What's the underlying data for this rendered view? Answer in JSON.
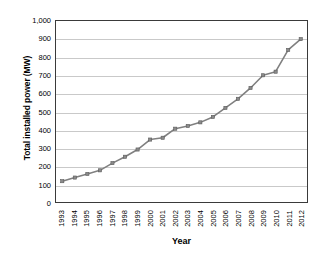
{
  "chart_data": {
    "type": "line",
    "title": "",
    "xlabel": "Year",
    "ylabel": "Total installed power (MW)",
    "categories": [
      "1993",
      "1994",
      "1995",
      "1996",
      "1997",
      "1998",
      "1999",
      "2000",
      "2001",
      "2002",
      "2003",
      "2004",
      "2005",
      "2006",
      "2007",
      "2008",
      "2009",
      "2010",
      "2011",
      "2012"
    ],
    "values": [
      115,
      135,
      155,
      175,
      215,
      250,
      290,
      345,
      355,
      405,
      420,
      440,
      470,
      520,
      570,
      630,
      700,
      720,
      840,
      900
    ],
    "series": [
      {
        "name": "Total installed power",
        "values": [
          115,
          135,
          155,
          175,
          215,
          250,
          290,
          345,
          355,
          405,
          420,
          440,
          470,
          520,
          570,
          630,
          700,
          720,
          840,
          900
        ]
      }
    ],
    "ylim": [
      0,
      1000
    ],
    "ytick_labels": [
      "1,000",
      "900",
      "800",
      "700",
      "600",
      "500",
      "400",
      "300",
      "200",
      "100",
      "0"
    ],
    "ytick_values": [
      1000,
      900,
      800,
      700,
      600,
      500,
      400,
      300,
      200,
      100,
      0
    ],
    "grid": "horizontal",
    "legend": "none",
    "line_color": "#808080",
    "marker_color": "#8a8a8a",
    "marker_edge_color": "#5a5a5a",
    "marker": "square",
    "gridline_color": "#c9c9c9",
    "axis_color": "#3a3a3a",
    "background_color": "#ffffff"
  }
}
